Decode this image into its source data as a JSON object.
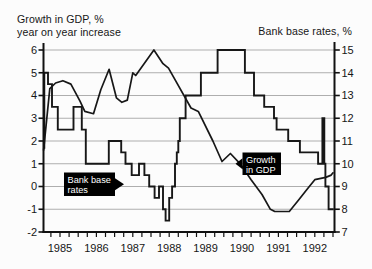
{
  "chart_data": {
    "type": "line",
    "left_axis": {
      "title_lines": [
        "Growth in GDP, %",
        "year on year increase"
      ],
      "ticks": [
        6,
        5,
        4,
        3,
        2,
        1,
        0,
        -1,
        -2
      ],
      "range": [
        -2,
        6
      ]
    },
    "right_axis": {
      "title": "Bank base rates, %",
      "ticks": [
        15,
        14,
        13,
        12,
        11,
        10,
        9,
        8,
        7
      ],
      "range": [
        7,
        15
      ]
    },
    "x_axis": {
      "tick_labels": [
        "1985",
        "1986",
        "1987",
        "1988",
        "1989",
        "1990",
        "1991",
        "1992"
      ],
      "range": [
        1985.0,
        1993.05
      ],
      "minor_tick_interval_years": 0.25
    },
    "grid": "horizontal-only",
    "series": [
      {
        "name": "Growth in GDP",
        "axis": "left",
        "line_style": "segments",
        "points": [
          [
            1985.05,
            1.6
          ],
          [
            1985.22,
            4.3
          ],
          [
            1985.38,
            4.55
          ],
          [
            1985.58,
            4.65
          ],
          [
            1985.8,
            4.5
          ],
          [
            1986.05,
            3.75
          ],
          [
            1986.18,
            3.3
          ],
          [
            1986.42,
            3.2
          ],
          [
            1986.62,
            4.25
          ],
          [
            1986.85,
            5.15
          ],
          [
            1987.05,
            3.9
          ],
          [
            1987.2,
            3.7
          ],
          [
            1987.35,
            3.8
          ],
          [
            1987.5,
            5.0
          ],
          [
            1987.58,
            4.88
          ],
          [
            1988.08,
            6.0
          ],
          [
            1988.33,
            5.4
          ],
          [
            1988.48,
            5.2
          ],
          [
            1988.66,
            4.7
          ],
          [
            1989.1,
            3.45
          ],
          [
            1989.3,
            3.3
          ],
          [
            1989.7,
            2.0
          ],
          [
            1989.95,
            1.1
          ],
          [
            1990.18,
            1.45
          ],
          [
            1990.45,
            1.0
          ],
          [
            1990.75,
            0.3
          ],
          [
            1991.05,
            -0.35
          ],
          [
            1991.28,
            -1.0
          ],
          [
            1991.4,
            -1.1
          ],
          [
            1991.8,
            -1.1
          ],
          [
            1992.05,
            -0.6
          ],
          [
            1992.3,
            -0.1
          ],
          [
            1992.5,
            0.3
          ],
          [
            1992.8,
            0.4
          ],
          [
            1992.95,
            0.5
          ],
          [
            1993.0,
            0.6
          ]
        ]
      },
      {
        "name": "Bank base rates",
        "axis": "right",
        "line_style": "step",
        "points": [
          [
            1985.05,
            10.7
          ],
          [
            1985.07,
            14
          ],
          [
            1985.17,
            13.5
          ],
          [
            1985.28,
            12.5
          ],
          [
            1985.44,
            11.5
          ],
          [
            1985.87,
            12.5
          ],
          [
            1986.1,
            11.5
          ],
          [
            1986.21,
            10
          ],
          [
            1986.84,
            11
          ],
          [
            1987.18,
            10.5
          ],
          [
            1987.3,
            10
          ],
          [
            1987.47,
            9.5
          ],
          [
            1987.67,
            10
          ],
          [
            1987.82,
            9.5
          ],
          [
            1987.95,
            9
          ],
          [
            1988.1,
            8.5
          ],
          [
            1988.22,
            9
          ],
          [
            1988.33,
            8
          ],
          [
            1988.4,
            7.5
          ],
          [
            1988.5,
            8.5
          ],
          [
            1988.58,
            9
          ],
          [
            1988.66,
            10
          ],
          [
            1988.71,
            10.5
          ],
          [
            1988.75,
            11
          ],
          [
            1988.79,
            12
          ],
          [
            1988.95,
            13
          ],
          [
            1989.37,
            14
          ],
          [
            1989.83,
            15
          ],
          [
            1990.58,
            14
          ],
          [
            1990.83,
            13
          ],
          [
            1991.11,
            12.5
          ],
          [
            1991.38,
            12
          ],
          [
            1991.45,
            11.5
          ],
          [
            1991.77,
            11
          ],
          [
            1992.09,
            10.5
          ],
          [
            1992.59,
            10
          ],
          [
            1992.71,
            12
          ],
          [
            1992.76,
            10
          ],
          [
            1992.79,
            9
          ],
          [
            1992.88,
            8
          ],
          [
            1993.02,
            8
          ]
        ]
      }
    ],
    "annotations": [
      {
        "lines": [
          "Bank base",
          "rates"
        ],
        "arrow_dir": "right",
        "box": {
          "x": 64,
          "y": 172.5,
          "w": 51,
          "h": 23.5
        },
        "target_series": "Bank base rates"
      },
      {
        "lines": [
          "Growth",
          "in GDP"
        ],
        "arrow_dir": "left",
        "box": {
          "x": 242.5,
          "y": 152.5,
          "w": 38.5,
          "h": 22.5
        },
        "target_series": "Growth in GDP"
      }
    ]
  },
  "colors": {
    "line": "#171717",
    "grid": "#aeaeae",
    "axis": "#111111",
    "annotation_bg": "#000000",
    "annotation_text": "#ffffff",
    "text": "#161616",
    "background": "#fcfcfc"
  }
}
